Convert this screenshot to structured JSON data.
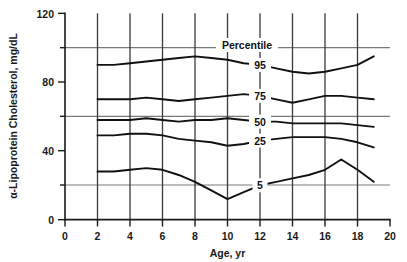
{
  "chart_data": {
    "type": "line",
    "title": "",
    "xlabel": "Age, yr",
    "ylabel": "α-Lipoprotein Cholesterol, mg/dL",
    "xlim": [
      0,
      20
    ],
    "ylim": [
      0,
      120
    ],
    "xticks": [
      0,
      2,
      4,
      6,
      8,
      10,
      12,
      14,
      16,
      18,
      20
    ],
    "xtick_labels": [
      "0",
      "2",
      "4",
      "6",
      "8",
      "10",
      "12",
      "14",
      "16",
      "18",
      "20"
    ],
    "yticks": [
      0,
      20,
      40,
      60,
      80,
      100,
      120
    ],
    "ytick_labels": [
      "0",
      "",
      "40",
      "",
      "80",
      "",
      "120"
    ],
    "ylabeled_ticks": [
      0,
      40,
      80,
      120
    ],
    "grid": {
      "horizontal_at": [
        20,
        60,
        100
      ],
      "vertical_at": [
        2,
        4,
        6,
        8,
        10,
        12,
        14,
        16,
        18
      ],
      "horizontal_on": true,
      "vertical_on": true
    },
    "legend_title": "Percentile",
    "legend_position": "inline-right-of-curves",
    "series": [
      {
        "name": "95",
        "label": "95",
        "x": [
          2,
          3,
          4,
          5,
          6,
          7,
          8,
          9,
          10,
          11,
          12,
          13,
          14,
          15,
          16,
          17,
          18,
          19
        ],
        "values": [
          90,
          90,
          91,
          92,
          93,
          94,
          95,
          94,
          93,
          91,
          90,
          88,
          86,
          85,
          86,
          88,
          90,
          95
        ]
      },
      {
        "name": "75",
        "label": "75",
        "x": [
          2,
          3,
          4,
          5,
          6,
          7,
          8,
          9,
          10,
          11,
          12,
          13,
          14,
          15,
          16,
          17,
          18,
          19
        ],
        "values": [
          70,
          70,
          70,
          71,
          70,
          69,
          70,
          71,
          72,
          73,
          72,
          70,
          68,
          70,
          72,
          72,
          71,
          70
        ]
      },
      {
        "name": "50",
        "label": "50",
        "x": [
          2,
          3,
          4,
          5,
          6,
          7,
          8,
          9,
          10,
          11,
          12,
          13,
          14,
          15,
          16,
          17,
          18,
          19
        ],
        "values": [
          58,
          58,
          58,
          59,
          58,
          57,
          58,
          58,
          59,
          58,
          57,
          57,
          56,
          56,
          56,
          56,
          55,
          54
        ]
      },
      {
        "name": "25",
        "label": "25",
        "x": [
          2,
          3,
          4,
          5,
          6,
          7,
          8,
          9,
          10,
          11,
          12,
          13,
          14,
          15,
          16,
          17,
          18,
          19
        ],
        "values": [
          49,
          49,
          50,
          50,
          49,
          47,
          46,
          45,
          43,
          44,
          46,
          47,
          48,
          48,
          48,
          47,
          45,
          42
        ]
      },
      {
        "name": "5",
        "label": "5",
        "x": [
          2,
          3,
          4,
          5,
          6,
          7,
          8,
          9,
          10,
          11,
          12,
          13,
          14,
          15,
          16,
          17,
          18,
          19
        ],
        "values": [
          28,
          28,
          29,
          30,
          29,
          26,
          22,
          17,
          12,
          16,
          20,
          22,
          24,
          26,
          29,
          35,
          29,
          22
        ]
      }
    ]
  },
  "axes": {
    "x_title": "Age, yr",
    "y_title": "α-Lipoprotein Cholesterol, mg/dL"
  },
  "legend": {
    "title": "Percentile"
  }
}
